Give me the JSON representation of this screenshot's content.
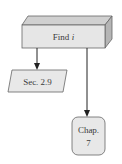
{
  "diagram": {
    "type": "flowchart",
    "nodes": [
      {
        "id": "find",
        "shape": "3d-box",
        "label_prefix": "Find ",
        "label_var": "i"
      },
      {
        "id": "sec",
        "shape": "parallelogram",
        "label": "Sec. 2.9"
      },
      {
        "id": "chap",
        "shape": "rounded-rect",
        "label_line1": "Chap.",
        "label_line2": "7"
      }
    ],
    "edges": [
      {
        "from": "find",
        "to": "sec",
        "arrow": true
      },
      {
        "from": "find",
        "to": "chap",
        "arrow": true
      }
    ],
    "colors": {
      "box_front": "#e6e6e6",
      "box_top": "#cfcfcf",
      "box_side": "#b8b8b8",
      "node_fill": "#e8e8e8",
      "stroke": "#555555",
      "arrow": "#222222"
    }
  }
}
